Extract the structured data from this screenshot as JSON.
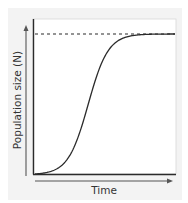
{
  "chart_data": {
    "type": "line",
    "title": "",
    "xlabel": "Time",
    "ylabel": "Population size (N)",
    "grid": false,
    "legend": null,
    "axis_ticks": false,
    "series": [
      {
        "name": "Logistic growth",
        "style": "solid",
        "x": [
          0,
          0.05,
          0.1,
          0.15,
          0.2,
          0.25,
          0.3,
          0.35,
          0.4,
          0.45,
          0.5,
          0.55,
          0.6,
          0.65,
          0.7,
          0.8,
          0.9,
          1.0
        ],
        "y": [
          0.0,
          0.003,
          0.015,
          0.04,
          0.1,
          0.22,
          0.42,
          0.65,
          0.82,
          0.92,
          0.965,
          0.985,
          0.995,
          1.0,
          1.0,
          1.0,
          1.0,
          1.0
        ]
      },
      {
        "name": "Carrying capacity (K)",
        "style": "dashed",
        "x": [
          0,
          1.0
        ],
        "y": [
          1.0,
          1.0
        ]
      }
    ],
    "xlim": [
      0,
      1
    ],
    "ylim": [
      0,
      1.1
    ],
    "annotations": []
  },
  "colors": {
    "curve": "#2b2b2b",
    "axes": "#2b2b2b",
    "dashed_line": "#2b2b2b",
    "panel_background": "#f3f3f3",
    "plot_background": "#ffffff",
    "text": "#333333"
  },
  "labels": {
    "x": "Time",
    "y": "Population size (N)"
  }
}
